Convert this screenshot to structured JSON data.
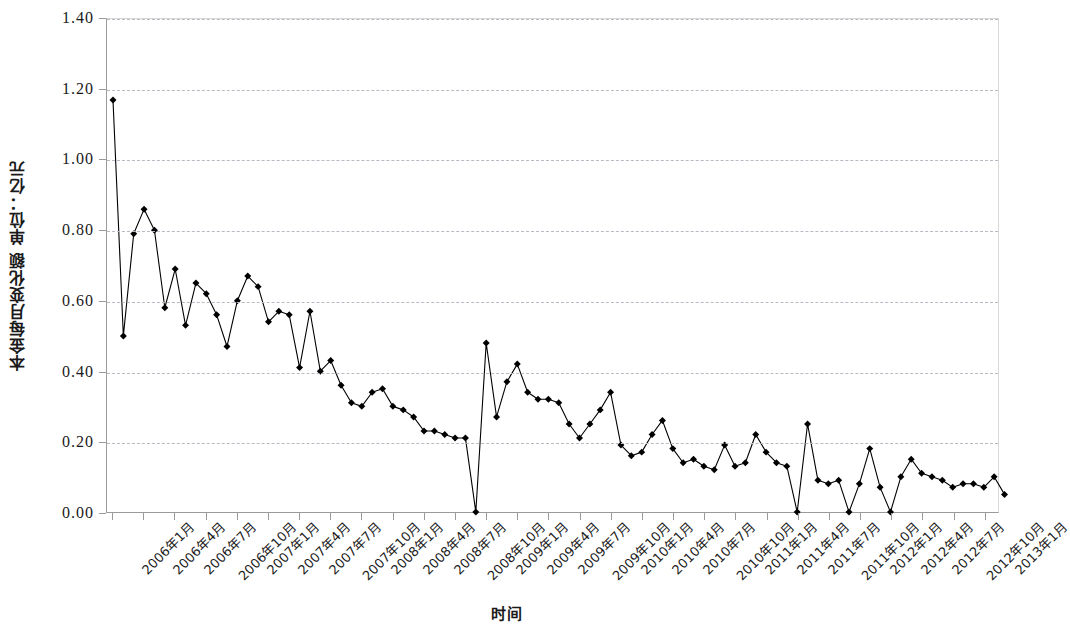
{
  "chart_data": {
    "type": "line",
    "title": "",
    "xlabel": "时间",
    "ylabel": "本金每月变化额 单位：亿元",
    "ylim": [
      0.0,
      1.4
    ],
    "ytick_labels": [
      "0.00",
      "0.20",
      "0.40",
      "0.60",
      "0.80",
      "1.00",
      "1.20",
      "1.40"
    ],
    "ytick_values": [
      0.0,
      0.2,
      0.4,
      0.6,
      0.8,
      1.0,
      1.2,
      1.4
    ],
    "grid": true,
    "legend": "none",
    "marker": "diamond",
    "line_color": "#000000",
    "marker_color": "#000000",
    "grid_color": "#b9b9c4",
    "x_tick_labels": [
      "2006年1月",
      "2006年4月",
      "2006年7月",
      "2006年10月",
      "2007年1月",
      "2007年4月",
      "2007年7月",
      "2007年10月",
      "2008年1月",
      "2008年4月",
      "2008年7月",
      "2008年10月",
      "2009年1月",
      "2009年4月",
      "2009年7月",
      "2009年10月",
      "2010年1月",
      "2010年4月",
      "2010年7月",
      "2010年10月",
      "2011年1月",
      "2011年4月",
      "2011年7月",
      "2011年10月",
      "2012年1月",
      "2012年4月",
      "2012年7月",
      "2012年10月",
      "2013年1月"
    ],
    "x_tick_interval_months": 3,
    "x_start": "2006年1月",
    "x_end": "2013年1月",
    "x_point_interval_months": 1,
    "values": [
      1.17,
      0.5,
      0.79,
      0.86,
      0.8,
      0.58,
      0.69,
      0.53,
      0.65,
      0.62,
      0.56,
      0.47,
      0.6,
      0.67,
      0.64,
      0.54,
      0.57,
      0.56,
      0.41,
      0.57,
      0.4,
      0.43,
      0.36,
      0.31,
      0.3,
      0.34,
      0.35,
      0.3,
      0.29,
      0.27,
      0.23,
      0.23,
      0.22,
      0.21,
      0.21,
      0.0,
      0.48,
      0.27,
      0.37,
      0.42,
      0.34,
      0.32,
      0.32,
      0.31,
      0.25,
      0.21,
      0.25,
      0.29,
      0.34,
      0.19,
      0.16,
      0.17,
      0.22,
      0.26,
      0.18,
      0.14,
      0.15,
      0.13,
      0.12,
      0.19,
      0.13,
      0.14,
      0.22,
      0.17,
      0.14,
      0.13,
      0.0,
      0.25,
      0.09,
      0.08,
      0.09,
      0.0,
      0.08,
      0.18,
      0.07,
      0.0,
      0.1,
      0.15,
      0.11,
      0.1,
      0.09,
      0.07,
      0.08,
      0.08,
      0.07,
      0.1,
      0.05
    ]
  }
}
